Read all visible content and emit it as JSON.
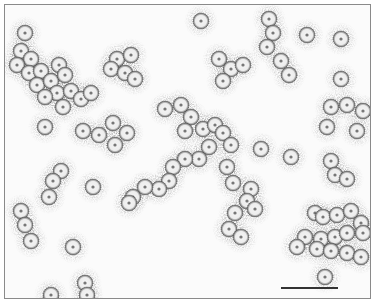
{
  "image": {
    "description": "Negative-stain electron micrograph of clustered icosahedral virus particles",
    "background": "#fbfbfb",
    "border_color": "#8a8a8a"
  },
  "scale_bar": {
    "x": 281,
    "y": 287,
    "width": 57,
    "color": "#333333"
  },
  "particle_radius": 8,
  "particles": [
    [
      24,
      32
    ],
    [
      20,
      50
    ],
    [
      30,
      58
    ],
    [
      16,
      64
    ],
    [
      28,
      72
    ],
    [
      40,
      70
    ],
    [
      36,
      84
    ],
    [
      50,
      80
    ],
    [
      58,
      64
    ],
    [
      64,
      74
    ],
    [
      56,
      92
    ],
    [
      44,
      96
    ],
    [
      70,
      90
    ],
    [
      62,
      106
    ],
    [
      80,
      98
    ],
    [
      90,
      92
    ],
    [
      44,
      126
    ],
    [
      82,
      130
    ],
    [
      98,
      134
    ],
    [
      112,
      122
    ],
    [
      126,
      132
    ],
    [
      114,
      144
    ],
    [
      116,
      58
    ],
    [
      130,
      54
    ],
    [
      110,
      68
    ],
    [
      124,
      72
    ],
    [
      134,
      78
    ],
    [
      200,
      20
    ],
    [
      268,
      18
    ],
    [
      272,
      32
    ],
    [
      266,
      46
    ],
    [
      280,
      60
    ],
    [
      288,
      74
    ],
    [
      218,
      58
    ],
    [
      230,
      68
    ],
    [
      242,
      64
    ],
    [
      222,
      80
    ],
    [
      306,
      34
    ],
    [
      340,
      38
    ],
    [
      340,
      78
    ],
    [
      330,
      106
    ],
    [
      346,
      104
    ],
    [
      362,
      110
    ],
    [
      326,
      126
    ],
    [
      356,
      130
    ],
    [
      164,
      108
    ],
    [
      180,
      104
    ],
    [
      190,
      116
    ],
    [
      184,
      130
    ],
    [
      202,
      128
    ],
    [
      214,
      124
    ],
    [
      222,
      132
    ],
    [
      230,
      144
    ],
    [
      208,
      146
    ],
    [
      198,
      158
    ],
    [
      184,
      158
    ],
    [
      172,
      166
    ],
    [
      168,
      180
    ],
    [
      158,
      188
    ],
    [
      144,
      186
    ],
    [
      132,
      196
    ],
    [
      128,
      202
    ],
    [
      260,
      148
    ],
    [
      290,
      156
    ],
    [
      226,
      166
    ],
    [
      232,
      182
    ],
    [
      250,
      188
    ],
    [
      246,
      200
    ],
    [
      254,
      208
    ],
    [
      234,
      212
    ],
    [
      228,
      228
    ],
    [
      240,
      236
    ],
    [
      60,
      170
    ],
    [
      52,
      180
    ],
    [
      48,
      196
    ],
    [
      20,
      210
    ],
    [
      24,
      224
    ],
    [
      30,
      240
    ],
    [
      92,
      186
    ],
    [
      72,
      246
    ],
    [
      84,
      282
    ],
    [
      86,
      294
    ],
    [
      50,
      294
    ],
    [
      330,
      160
    ],
    [
      334,
      174
    ],
    [
      346,
      178
    ],
    [
      314,
      212
    ],
    [
      322,
      216
    ],
    [
      336,
      214
    ],
    [
      350,
      210
    ],
    [
      360,
      222
    ],
    [
      304,
      236
    ],
    [
      320,
      238
    ],
    [
      334,
      236
    ],
    [
      346,
      232
    ],
    [
      362,
      232
    ],
    [
      296,
      246
    ],
    [
      316,
      248
    ],
    [
      330,
      250
    ],
    [
      346,
      252
    ],
    [
      360,
      256
    ],
    [
      324,
      276
    ]
  ]
}
